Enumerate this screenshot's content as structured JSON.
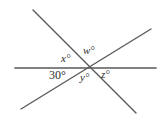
{
  "figure": {
    "type": "geometry-diagram",
    "background_color": "#ffffff",
    "line_color": "#555555",
    "text_color": "#2b2b2b",
    "canvas": {
      "width": 167,
      "height": 125
    },
    "intersection_point": {
      "x": 86,
      "y": 68
    },
    "lines": [
      {
        "name": "horizontal-line",
        "x1": 15,
        "y1": 68,
        "x2": 156,
        "y2": 68,
        "stroke_width": 1.6
      },
      {
        "name": "descending-line",
        "x1": 33,
        "y1": 10,
        "x2": 136,
        "y2": 113,
        "stroke_width": 1.4
      },
      {
        "name": "ascending-line",
        "x1": 21,
        "y1": 109,
        "x2": 151,
        "y2": 29,
        "stroke_width": 1.4
      }
    ],
    "labels": [
      {
        "id": "x",
        "text": "x°",
        "italic": true,
        "x": 61,
        "y": 53
      },
      {
        "id": "w",
        "text": "w°",
        "italic": true,
        "x": 83,
        "y": 45
      },
      {
        "id": "a30",
        "text": "30°",
        "italic": false,
        "x": 49,
        "y": 69
      },
      {
        "id": "y",
        "text": "y°",
        "italic": true,
        "x": 80,
        "y": 72
      },
      {
        "id": "z",
        "text": "z°",
        "italic": true,
        "x": 101,
        "y": 69
      }
    ]
  }
}
